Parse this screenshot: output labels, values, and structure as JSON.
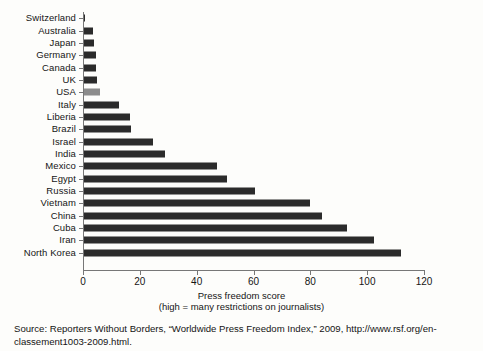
{
  "chart_data": {
    "type": "bar",
    "orientation": "horizontal",
    "title": "",
    "xlabel": "Press freedom score",
    "xsublabel": "(high = many restrictions on journalists)",
    "ylabel": "",
    "xlim": [
      0,
      120
    ],
    "xticks": [
      0,
      20,
      40,
      60,
      80,
      100,
      120
    ],
    "xtick_labels": [
      "0",
      "20",
      "40",
      "60",
      "80",
      "100",
      "120"
    ],
    "grid": false,
    "legend": null,
    "bar_color": "#2b2b2b",
    "highlight_color": "#8c8c8c",
    "highlight_category": "USA",
    "categories": [
      "Switzerland",
      "Australia",
      "Japan",
      "Germany",
      "Canada",
      "UK",
      "USA",
      "Italy",
      "Liberia",
      "Brazil",
      "Israel",
      "India",
      "Mexico",
      "Egypt",
      "Russia",
      "Vietnam",
      "China",
      "Cuba",
      "Iran",
      "North Korea"
    ],
    "values": [
      0.5,
      3.5,
      4,
      4.5,
      4.75,
      5,
      6,
      12.5,
      16.5,
      17,
      24.5,
      29,
      47,
      50.5,
      60.5,
      80,
      84,
      93,
      102.5,
      112
    ]
  },
  "source": {
    "text": "Source: Reporters Without Borders, “Worldwide Press Freedom Index,” 2009, http://www.rsf.org/en-classement1003-2009.html."
  }
}
